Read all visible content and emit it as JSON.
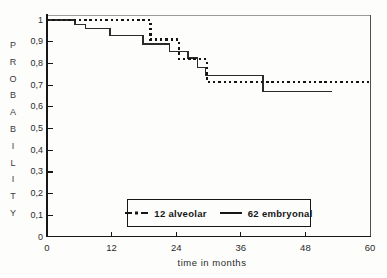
{
  "figure": {
    "ylabel_letters": [
      "P",
      "R",
      "O",
      "B",
      "A",
      "B",
      "I",
      "L",
      "I",
      "T",
      "Y"
    ],
    "xlabel": "time in months",
    "colors": {
      "curve": "#1a1a1a",
      "axis": "#161616",
      "frame_top": "#9a9a9a",
      "frame_right": "#4f4f4f",
      "text": "#2a2a2a"
    }
  },
  "chart_data": {
    "type": "line",
    "subtype": "kaplan_meier_step",
    "title": "",
    "xlabel": "time in months",
    "ylabel": "PROBABILITY",
    "xlim": [
      0,
      60
    ],
    "ylim": [
      0,
      1
    ],
    "grid": false,
    "legend_position": "inside lower right, boxed",
    "x_tick_values": [
      0,
      12,
      24,
      36,
      48,
      60
    ],
    "x_tick_labels": [
      "0",
      "12",
      "24",
      "36",
      "48",
      "60"
    ],
    "y_tick_values": [
      1,
      0.9,
      0.8,
      0.7,
      0.6,
      0.5,
      0.4,
      0.3,
      0.2,
      0.1,
      0
    ],
    "y_tick_labels": [
      "1",
      "0,9",
      "0,8",
      "0,7",
      "0,6",
      "0,5",
      "0,4",
      "0,3",
      "0,2",
      "0,1",
      "0"
    ],
    "series": [
      {
        "name": "12 alveolar",
        "line_style": "dotted",
        "steps": [
          [
            0,
            1.0
          ],
          [
            19.2,
            0.91
          ],
          [
            24.5,
            0.82
          ],
          [
            29.7,
            0.715
          ]
        ],
        "end_time": 60
      },
      {
        "name": "62 embryonal",
        "line_style": "solid",
        "steps": [
          [
            0,
            1.0
          ],
          [
            5.2,
            0.98
          ],
          [
            7.1,
            0.96
          ],
          [
            11.7,
            0.93
          ],
          [
            17.8,
            0.89
          ],
          [
            22.8,
            0.855
          ],
          [
            26.2,
            0.825
          ],
          [
            28.0,
            0.78
          ],
          [
            29.4,
            0.745
          ],
          [
            40.1,
            0.67
          ]
        ],
        "end_time": 53
      }
    ]
  }
}
